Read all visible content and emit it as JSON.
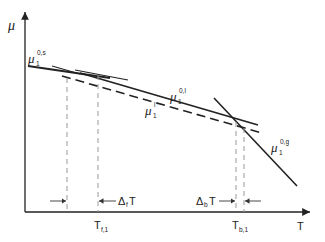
{
  "axes": {
    "y_label": "μ",
    "x_label": "T"
  },
  "curves": {
    "solid": {
      "base": "μ",
      "sub": "1",
      "sup": "0,s"
    },
    "liquid_pure": {
      "base": "μ",
      "sub": "1",
      "sup": "0,l"
    },
    "liquid_mix": {
      "base": "μ",
      "sub": "1",
      "sup": "l"
    },
    "gas": {
      "base": "μ",
      "sub": "1",
      "sup": "0,g"
    }
  },
  "ticks": {
    "tf": {
      "base": "T",
      "sub": "f,1"
    },
    "tb": {
      "base": "T",
      "sub": "b,1"
    }
  },
  "annotations": {
    "df": {
      "base": "Δ",
      "sub": "f",
      "tail": "T"
    },
    "db": {
      "base": "Δ",
      "sub": "b",
      "tail": "T"
    }
  }
}
